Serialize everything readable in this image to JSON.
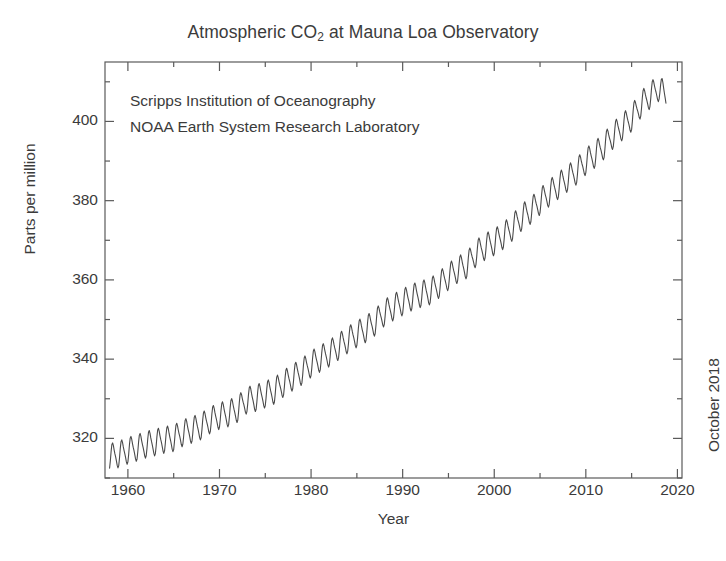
{
  "chart_data": {
    "type": "line",
    "title": "Atmospheric CO2 at Mauna Loa Observatory",
    "title_main": "Atmospheric CO",
    "title_sub": "2",
    "title_tail": " at Mauna Loa Observatory",
    "xlabel": "Year",
    "ylabel": "Parts per million",
    "annotations": [
      "Scripps Institution of Oceanography",
      "NOAA Earth System Research Laboratory"
    ],
    "side_annotation": "October 2018",
    "grid": false,
    "legend": "none",
    "line_color": "#4a4a4a",
    "axis_color": "#5a5a5a",
    "background": "#ffffff",
    "xlim": [
      1957.5,
      2020.5
    ],
    "ylim": [
      310,
      415
    ],
    "xticks": [
      1960,
      1970,
      1980,
      1990,
      2000,
      2010,
      2020
    ],
    "xtick_labels": [
      "1960",
      "1970",
      "1980",
      "1990",
      "2000",
      "2010",
      "2020"
    ],
    "xminor_ticks": [
      1965,
      1975,
      1985,
      1995,
      2005,
      2015
    ],
    "yticks": [
      320,
      340,
      360,
      380,
      400
    ],
    "ytick_labels": [
      "320",
      "340",
      "360",
      "380",
      "400"
    ],
    "yminor_ticks": [
      310,
      330,
      350,
      370,
      390,
      410
    ],
    "seasonal_amplitude_ppm": 3.1,
    "series": [
      {
        "name": "Monthly mean CO2 (ppm)",
        "description": "Keeling Curve: annual-mean trend with seasonal cycle",
        "annual_means": [
          {
            "year": 1958,
            "ppm": 315.3
          },
          {
            "year": 1959,
            "ppm": 315.98
          },
          {
            "year": 1960,
            "ppm": 316.91
          },
          {
            "year": 1961,
            "ppm": 317.64
          },
          {
            "year": 1962,
            "ppm": 318.45
          },
          {
            "year": 1963,
            "ppm": 318.99
          },
          {
            "year": 1964,
            "ppm": 319.62
          },
          {
            "year": 1965,
            "ppm": 320.04
          },
          {
            "year": 1966,
            "ppm": 321.37
          },
          {
            "year": 1967,
            "ppm": 322.18
          },
          {
            "year": 1968,
            "ppm": 323.05
          },
          {
            "year": 1969,
            "ppm": 324.62
          },
          {
            "year": 1970,
            "ppm": 325.68
          },
          {
            "year": 1971,
            "ppm": 326.32
          },
          {
            "year": 1972,
            "ppm": 327.46
          },
          {
            "year": 1973,
            "ppm": 329.68
          },
          {
            "year": 1974,
            "ppm": 330.19
          },
          {
            "year": 1975,
            "ppm": 331.12
          },
          {
            "year": 1976,
            "ppm": 332.03
          },
          {
            "year": 1977,
            "ppm": 333.84
          },
          {
            "year": 1978,
            "ppm": 335.41
          },
          {
            "year": 1979,
            "ppm": 336.84
          },
          {
            "year": 1980,
            "ppm": 338.76
          },
          {
            "year": 1981,
            "ppm": 340.12
          },
          {
            "year": 1982,
            "ppm": 341.48
          },
          {
            "year": 1983,
            "ppm": 343.15
          },
          {
            "year": 1984,
            "ppm": 344.85
          },
          {
            "year": 1985,
            "ppm": 346.35
          },
          {
            "year": 1986,
            "ppm": 347.61
          },
          {
            "year": 1987,
            "ppm": 349.31
          },
          {
            "year": 1988,
            "ppm": 351.69
          },
          {
            "year": 1989,
            "ppm": 353.12
          },
          {
            "year": 1990,
            "ppm": 354.39
          },
          {
            "year": 1991,
            "ppm": 355.61
          },
          {
            "year": 1992,
            "ppm": 356.45
          },
          {
            "year": 1993,
            "ppm": 357.1
          },
          {
            "year": 1994,
            "ppm": 358.83
          },
          {
            "year": 1995,
            "ppm": 360.82
          },
          {
            "year": 1996,
            "ppm": 362.61
          },
          {
            "year": 1997,
            "ppm": 363.73
          },
          {
            "year": 1998,
            "ppm": 366.7
          },
          {
            "year": 1999,
            "ppm": 368.38
          },
          {
            "year": 2000,
            "ppm": 369.55
          },
          {
            "year": 2001,
            "ppm": 371.14
          },
          {
            "year": 2002,
            "ppm": 373.28
          },
          {
            "year": 2003,
            "ppm": 375.8
          },
          {
            "year": 2004,
            "ppm": 377.52
          },
          {
            "year": 2005,
            "ppm": 379.8
          },
          {
            "year": 2006,
            "ppm": 381.9
          },
          {
            "year": 2007,
            "ppm": 383.79
          },
          {
            "year": 2008,
            "ppm": 385.6
          },
          {
            "year": 2009,
            "ppm": 387.43
          },
          {
            "year": 2010,
            "ppm": 389.9
          },
          {
            "year": 2011,
            "ppm": 391.65
          },
          {
            "year": 2012,
            "ppm": 393.85
          },
          {
            "year": 2013,
            "ppm": 396.52
          },
          {
            "year": 2014,
            "ppm": 398.65
          },
          {
            "year": 2015,
            "ppm": 400.83
          },
          {
            "year": 2016,
            "ppm": 404.24
          },
          {
            "year": 2017,
            "ppm": 406.55
          },
          {
            "year": 2018,
            "ppm": 408.52
          },
          {
            "year": 2018.79,
            "ppm": 406.0
          }
        ]
      }
    ]
  }
}
